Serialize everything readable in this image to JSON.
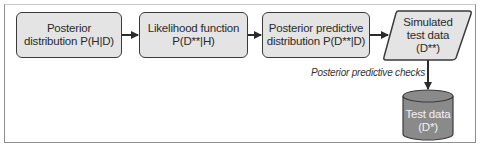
{
  "diagram": {
    "type": "flowchart",
    "nodes": [
      {
        "id": "posterior",
        "shape": "rounded-rect",
        "lines": [
          "Posterior",
          "distribution P(H|D)"
        ]
      },
      {
        "id": "likelihood",
        "shape": "rounded-rect",
        "lines": [
          "Likelihood function",
          "P(D**|H)"
        ]
      },
      {
        "id": "posterior_predictive",
        "shape": "rounded-rect",
        "lines": [
          "Posterior predictive",
          "distribution P(D**|D)"
        ]
      },
      {
        "id": "simulated",
        "shape": "parallelogram",
        "lines": [
          "Simulated",
          "test data",
          "(D**)"
        ]
      },
      {
        "id": "test_data",
        "shape": "cylinder",
        "lines": [
          "Test data",
          "(D*)"
        ]
      }
    ],
    "edges": [
      {
        "from": "posterior",
        "to": "likelihood",
        "label": ""
      },
      {
        "from": "likelihood",
        "to": "posterior_predictive",
        "label": ""
      },
      {
        "from": "posterior_predictive",
        "to": "simulated",
        "label": ""
      },
      {
        "from": "simulated",
        "to": "test_data",
        "label": "Posterior predictive checks"
      }
    ],
    "colors": {
      "box_fill": "#e4e4e4",
      "box_stroke": "#3a3a3a",
      "cylinder_fill": "#8a8a8a",
      "cylinder_text": "#f2f2f2",
      "arrow": "#2b2b2b",
      "frame": "#8e8e8e"
    }
  }
}
